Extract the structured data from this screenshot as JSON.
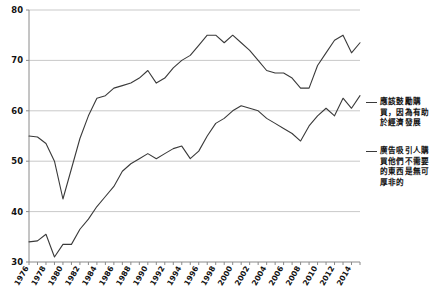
{
  "chart_data": {
    "type": "line",
    "title": "",
    "xlabel": "",
    "ylabel": "",
    "ylim": [
      30,
      80
    ],
    "xlim": [
      1976,
      2015
    ],
    "yticks": [
      30,
      40,
      50,
      60,
      70,
      80
    ],
    "grid": true,
    "legend_position": "right",
    "x": [
      1976,
      1977,
      1978,
      1979,
      1980,
      1981,
      1982,
      1983,
      1984,
      1985,
      1986,
      1987,
      1988,
      1989,
      1990,
      1991,
      1992,
      1993,
      1994,
      1995,
      1996,
      1997,
      1998,
      1999,
      2000,
      2001,
      2002,
      2003,
      2004,
      2005,
      2006,
      2007,
      2008,
      2009,
      2010,
      2011,
      2012,
      2013,
      2014,
      2015
    ],
    "xtick_labels": [
      "1976",
      "1978",
      "1980",
      "1982",
      "1984",
      "1986",
      "1988",
      "1990",
      "1992",
      "1994",
      "1996",
      "1998",
      "2000",
      "2002",
      "2004",
      "2006",
      "2008",
      "2010",
      "2012",
      "2014"
    ],
    "series": [
      {
        "name": "應該鼓勵購買，因為有助於經濟發展",
        "color": "#3a3a3a",
        "values": [
          55.0,
          54.8,
          53.5,
          50.0,
          42.5,
          48.5,
          54.5,
          59.0,
          62.5,
          63.0,
          64.5,
          65.0,
          65.5,
          66.5,
          68.0,
          65.5,
          66.5,
          68.5,
          70.0,
          71.0,
          73.0,
          75.0,
          75.0,
          73.5,
          75.0,
          73.5,
          72.0,
          70.0,
          68.0,
          67.5,
          67.5,
          66.5,
          64.5,
          64.5,
          69.0,
          71.5,
          74.0,
          75.0,
          71.5,
          73.5
        ]
      },
      {
        "name": "廣告吸引人購買他們不需要的東西是無可厚非的",
        "color": "#3a3a3a",
        "values": [
          34.0,
          34.2,
          35.5,
          31.0,
          33.5,
          33.5,
          36.5,
          38.5,
          41.0,
          43.0,
          45.0,
          48.0,
          49.5,
          50.5,
          51.5,
          50.5,
          51.5,
          52.5,
          53.0,
          50.5,
          52.0,
          55.0,
          57.5,
          58.5,
          60.0,
          61.0,
          60.5,
          60.0,
          58.5,
          57.5,
          56.5,
          55.5,
          54.0,
          57.0,
          59.0,
          60.5,
          59.0,
          62.5,
          60.5,
          63.0
        ]
      }
    ]
  },
  "legend": {
    "entries": [
      {
        "label": "應該鼓勵購買，因為有助於經濟發展"
      },
      {
        "label": "廣告吸引人購買他們不需要的東西是無可厚非的"
      }
    ]
  },
  "caption": {
    "text": ""
  }
}
